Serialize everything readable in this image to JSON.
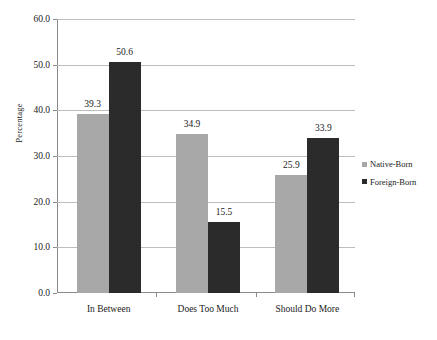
{
  "chart_data": {
    "type": "bar",
    "title": "",
    "xlabel": "",
    "ylabel": "Percentage",
    "ylim": [
      0,
      60
    ],
    "ytick_step": 10,
    "yticks": [
      "0.0",
      "10.0",
      "20.0",
      "30.0",
      "40.0",
      "50.0",
      "60.0"
    ],
    "ytick_values": [
      0,
      10,
      20,
      30,
      40,
      50,
      60
    ],
    "grid": true,
    "legend_position": "right",
    "categories": [
      "In Between",
      "Does Too Much",
      "Should Do More"
    ],
    "series": [
      {
        "name": "Native-Born",
        "color": "#a8a8a8",
        "values": [
          39.3,
          34.9,
          25.9
        ],
        "labels": [
          "39.3",
          "34.9",
          "25.9"
        ]
      },
      {
        "name": "Foreign-Born",
        "color": "#2b2b2b",
        "values": [
          50.6,
          15.5,
          33.9
        ],
        "labels": [
          "50.6",
          "15.5",
          "33.9"
        ]
      }
    ]
  },
  "legend": {
    "entries": [
      {
        "label": "Native-Born",
        "color": "#a8a8a8",
        "marker": "square-marker"
      },
      {
        "label": "Foreign-Born",
        "color": "#2b2b2b",
        "marker": "square-marker"
      }
    ]
  },
  "axis": {
    "y_title": "Percentage"
  },
  "colors": {
    "native_born": "#a8a8a8",
    "foreign_born": "#2b2b2b",
    "gridline": "#bdbdbd",
    "axis": "#8a8a8a",
    "text": "#1a1a1a",
    "background": "#ffffff"
  }
}
